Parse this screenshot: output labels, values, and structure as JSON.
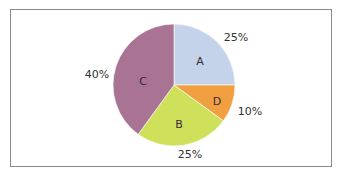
{
  "chart_data": {
    "type": "pie",
    "title": "",
    "start_angle_deg": 90,
    "direction": "clockwise",
    "slices": [
      {
        "label": "A",
        "value": 25,
        "percent_label": "25%",
        "color": "#c5d3ea"
      },
      {
        "label": "D",
        "value": 10,
        "percent_label": "10%",
        "color": "#f0a040"
      },
      {
        "label": "B",
        "value": 25,
        "percent_label": "25%",
        "color": "#cfe05a"
      },
      {
        "label": "C",
        "value": 40,
        "percent_label": "40%",
        "color": "#a97394"
      }
    ],
    "legend": "none"
  }
}
